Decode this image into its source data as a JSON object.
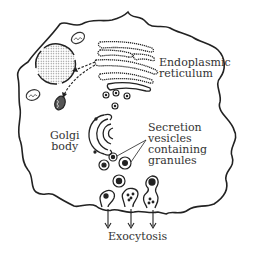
{
  "diagram": {
    "labels": {
      "endoplasmic_reticulum": [
        "Endoplasmic",
        "reticulum"
      ],
      "golgi_body": [
        "Golgi",
        "body"
      ],
      "secretion_vesicles": [
        "Secretion",
        "vesicles",
        "containing",
        "granules"
      ],
      "exocytosis": [
        "Exocytosis"
      ]
    },
    "components": [
      "cell-membrane",
      "endoplasmic-reticulum",
      "golgi-body",
      "secretion-vesicles",
      "lysosome-like-organelle",
      "mitochondria",
      "exocytosis-arrows"
    ],
    "colors": {
      "line": "#222222",
      "text": "#333333",
      "background": "#ffffff"
    }
  }
}
